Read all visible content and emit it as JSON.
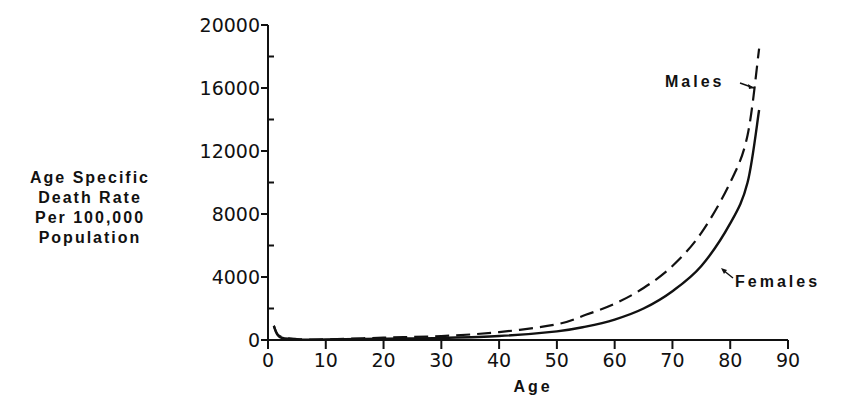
{
  "chart_data": {
    "type": "line",
    "title": "",
    "xlabel": "Age",
    "ylabel": [
      "Age Specific",
      "Death Rate",
      "Per 100,000",
      "Population"
    ],
    "xlim": [
      0,
      90
    ],
    "ylim": [
      0,
      20000
    ],
    "x_ticks": [
      "0",
      "10",
      "20",
      "30",
      "40",
      "50",
      "60",
      "70",
      "80",
      "90"
    ],
    "y_ticks": [
      "0",
      "4000",
      "8000",
      "12000",
      "16000",
      "20000"
    ],
    "grid": false,
    "legend": "inline annotations",
    "series": [
      {
        "name": "Males",
        "style": "dashed",
        "x": [
          1,
          2,
          5,
          10,
          20,
          30,
          40,
          50,
          55,
          60,
          65,
          70,
          75,
          80,
          83,
          85
        ],
        "values": [
          900,
          250,
          60,
          40,
          150,
          250,
          500,
          1000,
          1600,
          2300,
          3300,
          4700,
          6800,
          10000,
          13000,
          18500
        ]
      },
      {
        "name": "Females",
        "style": "solid",
        "x": [
          1,
          2,
          5,
          10,
          20,
          30,
          40,
          50,
          55,
          60,
          65,
          70,
          75,
          80,
          83,
          85
        ],
        "values": [
          900,
          200,
          40,
          30,
          80,
          130,
          250,
          550,
          850,
          1300,
          2000,
          3100,
          4700,
          7400,
          10000,
          14600
        ]
      }
    ],
    "annotations": [
      {
        "text": "Males",
        "points_to": "Males curve near age 85"
      },
      {
        "text": "Females",
        "points_to": "Females curve near age 78"
      }
    ]
  }
}
